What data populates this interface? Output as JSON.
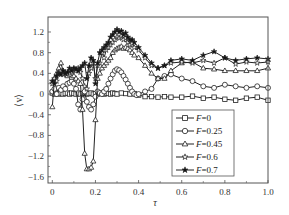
{
  "chart_data": {
    "type": "line",
    "title": "",
    "xlabel": "τ",
    "ylabel": "⟨v⟩",
    "xlim": [
      -0.02,
      1.0
    ],
    "ylim": [
      -1.72,
      1.49
    ],
    "xticks": [
      0,
      0.2,
      0.4,
      0.6,
      0.8,
      1.0
    ],
    "xtick_labels": [
      "0",
      "0.2",
      "0.4",
      "0.6",
      "0.8",
      "1.0"
    ],
    "yticks": [
      1.2,
      0.8,
      0.4,
      0,
      -0.4,
      -0.8,
      -1.2,
      -1.6
    ],
    "ytick_labels": [
      "1.2",
      "0.8",
      "0.4",
      "0",
      "−0.4",
      "−0.8",
      "−1.2",
      "−1.6"
    ],
    "grid": false,
    "legend_position": "lower right (inside)",
    "series": [
      {
        "name": "F=0",
        "label_prefix": "F",
        "label_value": "=0",
        "marker": "square",
        "x": [
          0,
          0.01,
          0.02,
          0.03,
          0.04,
          0.05,
          0.06,
          0.07,
          0.08,
          0.09,
          0.1,
          0.11,
          0.12,
          0.13,
          0.14,
          0.15,
          0.16,
          0.17,
          0.18,
          0.19,
          0.2,
          0.21,
          0.22,
          0.23,
          0.24,
          0.25,
          0.26,
          0.27,
          0.28,
          0.29,
          0.3,
          0.32,
          0.34,
          0.36,
          0.38,
          0.4,
          0.43,
          0.46,
          0.49,
          0.52,
          0.55,
          0.6,
          0.65,
          0.7,
          0.75,
          0.8,
          0.85,
          0.9,
          0.95,
          1.0
        ],
        "y": [
          0.02,
          0.0,
          0.03,
          0.0,
          0.02,
          0.0,
          0.01,
          0.02,
          0.0,
          0.02,
          0.01,
          0.0,
          0.02,
          0.0,
          0.01,
          0.02,
          0.0,
          0.01,
          0.02,
          0.0,
          0.01,
          0.0,
          0.02,
          0.01,
          0.0,
          0.02,
          0.01,
          0.0,
          0.02,
          0.01,
          0.0,
          0.02,
          0.01,
          0.0,
          0.01,
          -0.02,
          -0.05,
          -0.05,
          -0.06,
          -0.05,
          -0.06,
          -0.06,
          -0.04,
          -0.08,
          -0.06,
          -0.1,
          -0.12,
          -0.08,
          -0.06,
          -0.12
        ]
      },
      {
        "name": "F=0.25",
        "label_prefix": "F",
        "label_value": "=0.25",
        "marker": "circle",
        "x": [
          0,
          0.01,
          0.02,
          0.03,
          0.04,
          0.05,
          0.06,
          0.07,
          0.08,
          0.09,
          0.1,
          0.11,
          0.12,
          0.13,
          0.14,
          0.15,
          0.16,
          0.17,
          0.18,
          0.19,
          0.2,
          0.21,
          0.22,
          0.23,
          0.24,
          0.25,
          0.26,
          0.27,
          0.28,
          0.29,
          0.3,
          0.31,
          0.32,
          0.33,
          0.34,
          0.35,
          0.36,
          0.37,
          0.38,
          0.39,
          0.4,
          0.43,
          0.46,
          0.49,
          0.52,
          0.55,
          0.6,
          0.65,
          0.7,
          0.75,
          0.8,
          0.85,
          0.9,
          0.95,
          1.0
        ],
        "y": [
          0.05,
          0.1,
          0.0,
          0.12,
          0.08,
          0.15,
          0.1,
          0.2,
          0.22,
          0.25,
          0.2,
          0.1,
          -0.2,
          -0.3,
          -0.1,
          0.05,
          -0.15,
          -0.25,
          -0.3,
          -0.2,
          -0.05,
          0.05,
          0.02,
          0.0,
          0.05,
          0.1,
          0.2,
          0.3,
          0.38,
          0.45,
          0.48,
          0.46,
          0.42,
          0.35,
          0.28,
          0.2,
          0.12,
          0.05,
          0.0,
          -0.02,
          0.0,
          0.05,
          0.1,
          0.3,
          0.35,
          0.38,
          0.3,
          0.25,
          0.15,
          0.12,
          0.18,
          0.15,
          0.12,
          0.15,
          0.12
        ]
      },
      {
        "name": "F=0.45",
        "label_prefix": "F",
        "label_value": "=0.45",
        "marker": "triangle",
        "x": [
          0,
          0.01,
          0.02,
          0.03,
          0.04,
          0.05,
          0.06,
          0.07,
          0.08,
          0.09,
          0.1,
          0.11,
          0.12,
          0.13,
          0.14,
          0.15,
          0.16,
          0.17,
          0.18,
          0.19,
          0.2,
          0.21,
          0.22,
          0.23,
          0.24,
          0.25,
          0.26,
          0.27,
          0.28,
          0.29,
          0.3,
          0.31,
          0.32,
          0.33,
          0.34,
          0.35,
          0.36,
          0.37,
          0.38,
          0.4,
          0.43,
          0.46,
          0.49,
          0.52,
          0.55,
          0.6,
          0.65,
          0.7,
          0.75,
          0.8,
          0.85,
          0.9,
          0.95,
          1.0
        ],
        "y": [
          -0.25,
          0.3,
          0.4,
          0.5,
          0.6,
          0.45,
          0.4,
          0.35,
          0.38,
          0.32,
          0.35,
          0.3,
          0.25,
          0.2,
          -0.3,
          -1.15,
          -1.45,
          -1.45,
          -1.42,
          -1.3,
          -0.5,
          0.3,
          0.4,
          0.5,
          0.55,
          0.6,
          0.65,
          0.7,
          0.8,
          0.85,
          0.88,
          0.9,
          0.92,
          0.88,
          0.9,
          0.88,
          0.85,
          0.8,
          0.75,
          0.7,
          0.55,
          0.4,
          0.3,
          0.3,
          0.45,
          0.6,
          0.62,
          0.5,
          0.48,
          0.45,
          0.45,
          0.45,
          0.45,
          0.5
        ]
      },
      {
        "name": "F=0.6",
        "label_prefix": "F",
        "label_value": "=0.6",
        "marker": "star-open",
        "x": [
          0,
          0.01,
          0.02,
          0.03,
          0.04,
          0.05,
          0.06,
          0.07,
          0.08,
          0.09,
          0.1,
          0.11,
          0.12,
          0.13,
          0.14,
          0.15,
          0.16,
          0.17,
          0.18,
          0.19,
          0.2,
          0.21,
          0.22,
          0.23,
          0.24,
          0.25,
          0.26,
          0.27,
          0.28,
          0.29,
          0.3,
          0.31,
          0.32,
          0.33,
          0.34,
          0.35,
          0.36,
          0.37,
          0.38,
          0.4,
          0.43,
          0.46,
          0.49,
          0.52,
          0.55,
          0.6,
          0.65,
          0.7,
          0.75,
          0.8,
          0.85,
          0.9,
          0.95,
          1.0
        ],
        "y": [
          0.2,
          0.3,
          0.25,
          0.4,
          0.45,
          0.38,
          0.42,
          0.4,
          0.45,
          0.42,
          0.48,
          0.45,
          0.5,
          0.42,
          0.3,
          0.15,
          0.1,
          0.4,
          0.5,
          0.6,
          0.3,
          0.55,
          0.6,
          0.8,
          0.7,
          0.85,
          0.9,
          0.95,
          1.0,
          1.05,
          1.1,
          1.08,
          1.12,
          1.05,
          1.08,
          1.0,
          0.95,
          0.98,
          0.9,
          0.85,
          0.7,
          0.55,
          0.5,
          0.55,
          0.6,
          0.62,
          0.6,
          0.65,
          0.6,
          0.7,
          0.58,
          0.62,
          0.6,
          0.62
        ]
      },
      {
        "name": "F=0.7",
        "label_prefix": "F",
        "label_value": "=0.7",
        "marker": "star-filled",
        "x": [
          0,
          0.01,
          0.02,
          0.03,
          0.04,
          0.05,
          0.06,
          0.07,
          0.08,
          0.09,
          0.1,
          0.11,
          0.12,
          0.13,
          0.14,
          0.15,
          0.16,
          0.17,
          0.18,
          0.19,
          0.2,
          0.21,
          0.22,
          0.23,
          0.24,
          0.25,
          0.26,
          0.27,
          0.28,
          0.29,
          0.3,
          0.31,
          0.32,
          0.33,
          0.34,
          0.35,
          0.36,
          0.37,
          0.38,
          0.4,
          0.43,
          0.46,
          0.49,
          0.52,
          0.55,
          0.6,
          0.65,
          0.7,
          0.75,
          0.8,
          0.85,
          0.9,
          0.95,
          1.0
        ],
        "y": [
          0.25,
          0.2,
          0.35,
          0.4,
          0.38,
          0.45,
          0.4,
          0.42,
          0.5,
          0.45,
          0.5,
          0.48,
          0.45,
          0.5,
          0.55,
          0.6,
          0.3,
          0.55,
          0.7,
          0.65,
          0.2,
          0.6,
          0.8,
          0.85,
          0.9,
          0.95,
          1.0,
          1.1,
          1.15,
          1.2,
          1.25,
          1.2,
          1.22,
          1.15,
          1.18,
          1.1,
          1.05,
          1.05,
          1.0,
          0.9,
          0.75,
          0.6,
          0.5,
          0.55,
          0.65,
          0.68,
          0.65,
          0.75,
          0.82,
          0.7,
          0.65,
          0.68,
          0.7,
          0.68
        ]
      }
    ]
  }
}
